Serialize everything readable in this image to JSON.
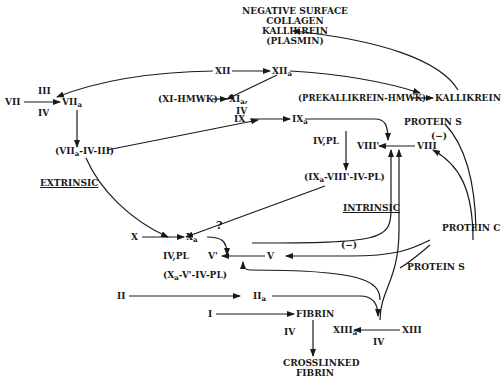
{
  "diagram": {
    "title_block": {
      "line1": "NEGATIVE SURFACE",
      "line2": "COLLAGEN",
      "line3": "KALLIKREIN",
      "line4": "(PLASMIN)"
    },
    "nodes": {
      "xii": "XII",
      "xiia_base": "XII",
      "xiia_sub": "a",
      "vii": "VII",
      "vii_cof_top": "III",
      "vii_cof_bot": "IV",
      "viia_base": "VII",
      "viia_sub": "a",
      "xi_hmwk": "(XI-HMWK)",
      "xia_base": "XI",
      "xia_sub": "a",
      "xia_comma": ",",
      "xia_cof": "IV",
      "prekallikrein_hmwk": "(PREKALLIKREIN-HMWK)",
      "kallikrein": "KALLIKREIN",
      "ix": "IX",
      "ixa_base": "IX",
      "ixa_sub": "a",
      "viia_complex_pre": "(VII",
      "viia_complex_sub": "a",
      "viia_complex_post": "-IV-III)",
      "extrinsic": "EXTRINSIC",
      "protein_s_top": "PROTEIN S",
      "viii": "VIII",
      "viii_prime": "VIII'",
      "neg_viii": "(−)",
      "iv_pl_top": "IV,PL",
      "ixa_complex_pre": "(IX",
      "ixa_complex_sub": "a",
      "ixa_complex_post": "-VIII'-IV-PL)",
      "intrinsic": "INTRINSIC",
      "protein_c": "PROTEIN C",
      "x": "X",
      "xa_base": "X",
      "xa_sub": "a",
      "question": "?",
      "iv_pl_bottom": "IV,PL",
      "v_prime": "V'",
      "v": "V",
      "neg_v": "(−)",
      "protein_s_bottom": "PROTEIN S",
      "xa_complex_pre": "(X",
      "xa_complex_sub": "a",
      "xa_complex_post": "-V'-IV-PL)",
      "ii": "II",
      "iia_base": "II",
      "iia_sub": "a",
      "i": "I",
      "fibrin": "FIBRIN",
      "fibrin_cof": "IV",
      "xiiia_base": "XIII",
      "xiiia_sub": "a",
      "xiii": "XIII",
      "xiii_cof": "IV",
      "crosslinked_line1": "CROSSLINKED",
      "crosslinked_line2": "FIBRIN"
    },
    "colors": {
      "ink": "#1a1a1a",
      "background": "#ffffff"
    }
  }
}
